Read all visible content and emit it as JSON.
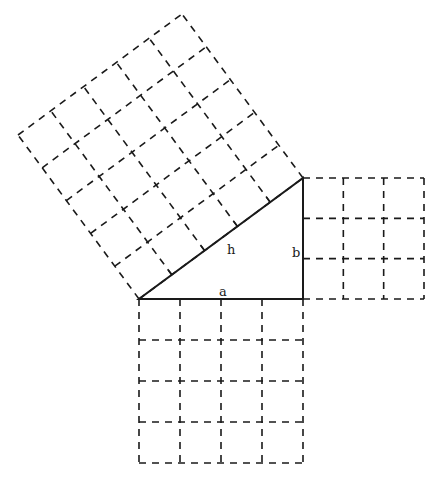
{
  "diagram": {
    "title": "",
    "labels": {
      "hypotenuse": "h",
      "vertical_leg": "b",
      "horizontal_leg": "a"
    },
    "triangle": {
      "vertices": [
        [
          139,
          299
        ],
        [
          303,
          299
        ],
        [
          303,
          178
        ]
      ],
      "right_angle_at": [
        303,
        299
      ]
    },
    "squares": [
      {
        "name": "square-on-a",
        "side": "a",
        "units": 4,
        "cells": 16
      },
      {
        "name": "square-on-b",
        "side": "b",
        "units": 3,
        "cells": 9
      },
      {
        "name": "square-on-h",
        "side": "h",
        "units": 5,
        "cells": 25
      }
    ],
    "colors": {
      "stroke": "#1a1a1a",
      "background": "#ffffff"
    }
  }
}
